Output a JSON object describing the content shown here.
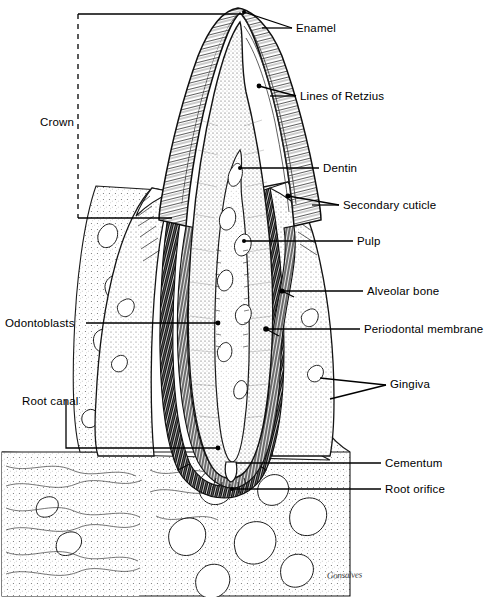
{
  "figure": {
    "signature": "Gonsalves",
    "ink_color": "#000000",
    "background_color": "#ffffff"
  },
  "labels": {
    "right": [
      {
        "id": "enamel",
        "text": "Enamel",
        "x": 296,
        "y": 23
      },
      {
        "id": "lines-of-retzius",
        "text": "Lines of Retzius",
        "x": 300,
        "y": 91
      },
      {
        "id": "dentin",
        "text": "Dentin",
        "x": 323,
        "y": 163
      },
      {
        "id": "secondary-cuticle",
        "text": "Secondary cuticle",
        "x": 343,
        "y": 200
      },
      {
        "id": "pulp",
        "text": "Pulp",
        "x": 357,
        "y": 236
      },
      {
        "id": "alveolar-bone",
        "text": "Alveolar bone",
        "x": 367,
        "y": 286
      },
      {
        "id": "periodontal-membrane",
        "text": "Periodontal membrane",
        "x": 364,
        "y": 324
      },
      {
        "id": "gingiva",
        "text": "Gingiva",
        "x": 390,
        "y": 383
      },
      {
        "id": "cementum",
        "text": "Cementum",
        "x": 385,
        "y": 458
      },
      {
        "id": "root-orifice",
        "text": "Root orifice",
        "x": 385,
        "y": 484
      }
    ],
    "left": [
      {
        "id": "crown",
        "text": "Crown",
        "x": 40,
        "y": 117
      },
      {
        "id": "odontoblasts",
        "text": "Odontoblasts",
        "x": 5,
        "y": 318
      },
      {
        "id": "root-canal",
        "text": "Root canal",
        "x": 22,
        "y": 396
      }
    ]
  },
  "structures": [
    {
      "id": "enamel",
      "name": "Enamel",
      "description": "Outer hard layer of the crown, drawn with fine radial hatching."
    },
    {
      "id": "lines-of-retzius",
      "name": "Lines of Retzius",
      "description": "Incremental growth lines arcing across the enamel."
    },
    {
      "id": "dentin",
      "name": "Dentin",
      "description": "Stippled body of the tooth beneath enamel and cementum."
    },
    {
      "id": "secondary-cuticle",
      "name": "Secondary cuticle",
      "description": "Thin layer at the enamel surface near the gingival margin."
    },
    {
      "id": "pulp",
      "name": "Pulp",
      "description": "Central soft-tissue chamber continuing into the root canal."
    },
    {
      "id": "alveolar-bone",
      "name": "Alveolar bone",
      "description": "Trabecular jaw bone forming the socket around the root."
    },
    {
      "id": "periodontal-membrane",
      "name": "Periodontal membrane",
      "description": "Dark fibrous band between cementum and alveolar bone."
    },
    {
      "id": "gingiva",
      "name": "Gingiva",
      "description": "Gum tissue cuffing the neck of the tooth."
    },
    {
      "id": "cementum",
      "name": "Cementum",
      "description": "Thin mineralised layer covering the root surface."
    },
    {
      "id": "root-orifice",
      "name": "Root orifice",
      "description": "Apical foramen where vessels and nerves enter the canal."
    },
    {
      "id": "crown",
      "name": "Crown",
      "description": "Portion of the tooth above the gum, marked by a dashed bracket."
    },
    {
      "id": "odontoblasts",
      "name": "Odontoblasts",
      "description": "Cell layer lining the pulp cavity wall."
    },
    {
      "id": "root-canal",
      "name": "Root canal",
      "description": "Narrow pulp channel running down the length of the root."
    }
  ]
}
